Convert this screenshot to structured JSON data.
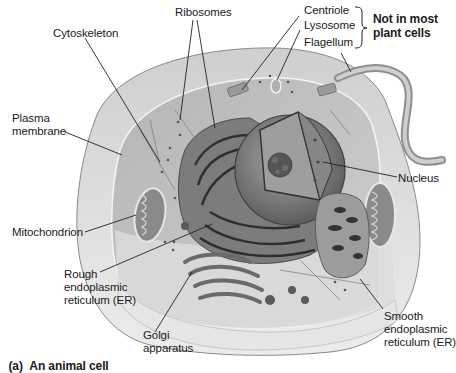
{
  "figure": {
    "caption_prefix": "(a)",
    "caption": "An animal cell",
    "colors": {
      "cytoplasm": "#bdbdbd",
      "outer_membrane": "#d9d9d9",
      "organelle_dark": "#6e6e6e",
      "nucleus": "#8c8c8c",
      "line": "#222222"
    }
  },
  "labels": {
    "ribosomes": "Ribosomes",
    "cytoskeleton": "Cytoskeleton",
    "centriole": "Centriole",
    "lysosome": "Lysosome",
    "flagellum": "Flagellum",
    "not_in_plant": "Not in most\nplant cells",
    "plasma_membrane": "Plasma\nmembrane",
    "nucleus": "Nucleus",
    "mitochondrion": "Mitochondrion",
    "rough_er": "Rough\nendoplasmic\nreticulum (ER)",
    "golgi": "Golgi\napparatus",
    "smooth_er": "Smooth\nendoplasmic\nreticulum (ER)"
  }
}
